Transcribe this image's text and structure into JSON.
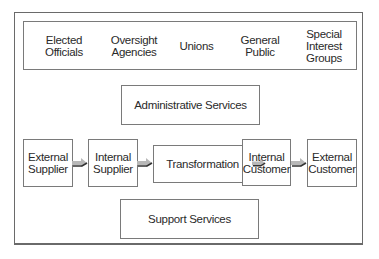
{
  "stakeholders": [
    {
      "line1": "Elected",
      "line2": "Officials",
      "line3": ""
    },
    {
      "line1": "Oversight",
      "line2": "Agencies",
      "line3": ""
    },
    {
      "line1": "Unions",
      "line2": "",
      "line3": ""
    },
    {
      "line1": "General",
      "line2": "Public",
      "line3": ""
    },
    {
      "line1": "Special",
      "line2": "Interest",
      "line3": "Groups"
    }
  ],
  "administrative": {
    "label": "Administrative Services"
  },
  "process": [
    {
      "line1": "External",
      "line2": "Supplier"
    },
    {
      "line1": "Internal",
      "line2": "Supplier"
    },
    {
      "line1": "Transformation",
      "line2": ""
    },
    {
      "line1": "Internal",
      "line2": "Customer"
    },
    {
      "line1": "External",
      "line2": "Customer"
    }
  ],
  "support": {
    "label": "Support Services"
  },
  "colors": {
    "border": "#7a7a7a",
    "arrow_fill": "#b8b8b8",
    "arrow_dark": "#333333",
    "text": "#2a2a2a"
  }
}
